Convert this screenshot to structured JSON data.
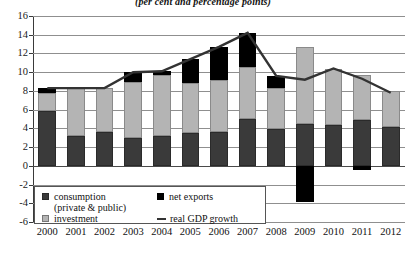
{
  "chart_data": {
    "type": "bar",
    "subtype": "stacked-bar-with-line",
    "title": "(per cent and percentage points)",
    "xlabel": "",
    "ylabel": "",
    "ylim": [
      -6,
      16
    ],
    "ytick_step": 2,
    "yticks": [
      "16",
      "14",
      "12",
      "10",
      "8",
      "6",
      "4",
      "2",
      "0",
      "-2",
      "-4",
      "-6"
    ],
    "grid": true,
    "legend_position": "bottom-left",
    "categories": [
      "2000",
      "2001",
      "2002",
      "2003",
      "2004",
      "2005",
      "2006",
      "2007",
      "2008",
      "2009",
      "2010",
      "2011",
      "2012"
    ],
    "series": [
      {
        "name": "consumption (private & public)",
        "type": "bar",
        "color": "#3a3a3a",
        "values": [
          5.9,
          3.2,
          3.6,
          3.0,
          3.2,
          3.5,
          3.6,
          5.0,
          3.9,
          4.5,
          4.4,
          4.9,
          4.1
        ]
      },
      {
        "name": "investment",
        "type": "bar",
        "color": "#b4b4b4",
        "values": [
          1.9,
          5.1,
          4.7,
          5.9,
          6.5,
          5.3,
          5.6,
          5.6,
          4.4,
          8.2,
          5.9,
          4.8,
          3.9
        ]
      },
      {
        "name": "net exports",
        "type": "bar",
        "color": "#000000",
        "values": [
          0.5,
          0.0,
          0.0,
          1.1,
          0.4,
          2.6,
          3.5,
          3.6,
          1.3,
          -3.9,
          0.0,
          -0.4,
          0.0
        ]
      },
      {
        "name": "real GDP growth",
        "type": "line",
        "color": "#333333",
        "values": [
          8.3,
          8.3,
          8.3,
          10.0,
          10.1,
          11.4,
          12.7,
          14.2,
          9.6,
          9.2,
          10.4,
          9.3,
          7.8
        ]
      }
    ]
  },
  "legend": {
    "consumption_line1": "consumption",
    "consumption_line2": "(private & public)",
    "investment": "investment",
    "net_exports": "net exports",
    "real_gdp_growth": "real GDP growth"
  }
}
